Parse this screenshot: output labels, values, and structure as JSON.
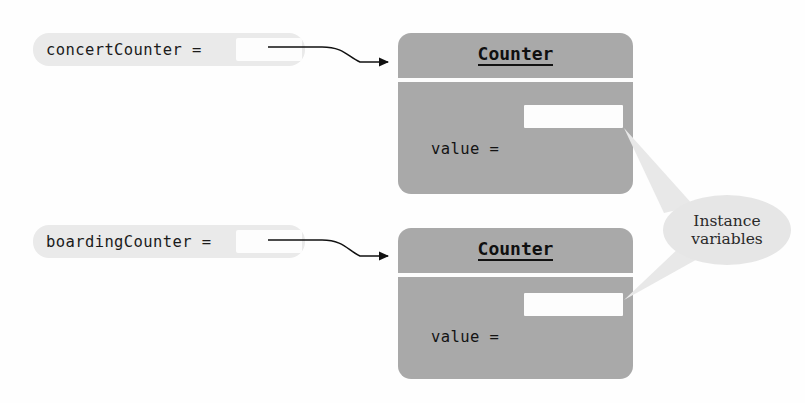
{
  "diagram": {
    "title_text_present": false,
    "colors": {
      "object_gray": "#a9a9a9",
      "label_halo_gray": "#eaeaea",
      "slot_white": "#fdfdfd",
      "callout_gray": "#e6e6e6",
      "text_dark": "#141414",
      "arrow_black": "#111111"
    },
    "rows": [
      {
        "variable": {
          "name": "concertCounter =",
          "reference_value": ""
        },
        "object": {
          "class_name": "Counter",
          "fields": [
            {
              "name": "value =",
              "value": ""
            }
          ]
        }
      },
      {
        "variable": {
          "name": "boardingCounter =",
          "reference_value": ""
        },
        "object": {
          "class_name": "Counter",
          "fields": [
            {
              "name": "value =",
              "value": ""
            }
          ]
        }
      }
    ],
    "callout": {
      "line1": "Instance",
      "line2": "variables"
    }
  }
}
